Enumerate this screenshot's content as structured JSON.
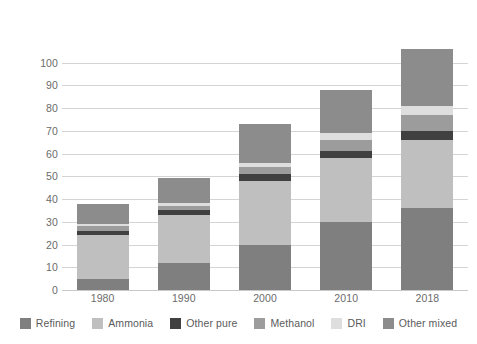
{
  "chart_data": {
    "type": "bar",
    "subtype": "stacked-vertical",
    "title": "",
    "xlabel": "",
    "ylabel": "Million tonnes of hydrogen",
    "categories": [
      "1980",
      "1990",
      "2000",
      "2010",
      "2018"
    ],
    "ylim": [
      0,
      110
    ],
    "yticks": [
      0,
      10,
      20,
      30,
      40,
      50,
      60,
      70,
      80,
      90,
      100
    ],
    "ytick_labels": [
      "0",
      "10",
      "20",
      "30",
      "40",
      "50",
      "60",
      "70",
      "80",
      "90",
      "100"
    ],
    "grid": true,
    "grid_axis": "y",
    "legend_position": "bottom",
    "stack_order": "bottom-to-top",
    "series": [
      {
        "name": "Refining",
        "color": "#7f7f7f",
        "values": [
          5,
          12,
          20,
          30,
          36
        ]
      },
      {
        "name": "Ammonia",
        "color": "#bfbfbf",
        "values": [
          19,
          21,
          28,
          28,
          30
        ]
      },
      {
        "name": "Other pure",
        "color": "#404040",
        "values": [
          2,
          2,
          3,
          3,
          4
        ]
      },
      {
        "name": "Methanol",
        "color": "#9c9c9c",
        "values": [
          2,
          2,
          3,
          5,
          7
        ]
      },
      {
        "name": "DRI",
        "color": "#dedede",
        "values": [
          1,
          1.5,
          2,
          3,
          4
        ]
      },
      {
        "name": "Other mixed",
        "color": "#8c8c8c",
        "values": [
          9,
          11,
          17,
          19,
          25
        ]
      }
    ],
    "totals": [
      38,
      49.5,
      73,
      88,
      106
    ]
  },
  "legend": {
    "items": [
      {
        "label": "Refining",
        "color": "#7f7f7f"
      },
      {
        "label": "Ammonia",
        "color": "#bfbfbf"
      },
      {
        "label": "Other pure",
        "color": "#404040"
      },
      {
        "label": "Methanol",
        "color": "#9c9c9c"
      },
      {
        "label": "DRI",
        "color": "#dedede"
      },
      {
        "label": "Other mixed",
        "color": "#8c8c8c"
      }
    ]
  }
}
